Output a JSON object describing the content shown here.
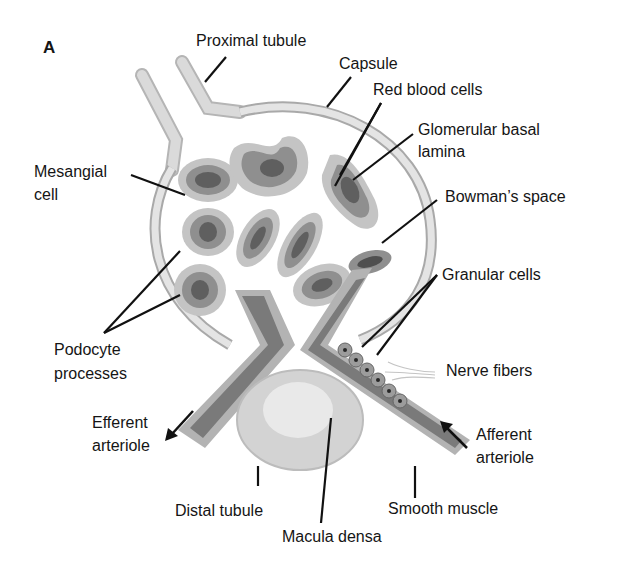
{
  "panel_letter": "A",
  "colors": {
    "background": "#ffffff",
    "capsule_fill": "#e2e2e2",
    "capsule_stroke": "#a9a9a9",
    "capillary_outer": "#bdbdbd",
    "capillary_mid": "#8f8f8f",
    "capillary_core": "#5f5f5f",
    "nucleus": "#262626",
    "arteriole_fill": "#7a7a7a",
    "arteriole_cells": "#b3b3b3",
    "tubule_fill": "#d3d3d3",
    "tubule_lumen": "#e9e9e9",
    "leader_line": "#111111",
    "text": "#151515"
  },
  "labels": {
    "proximal_tubule": "Proximal tubule",
    "capsule": "Capsule",
    "red_blood_cells": "Red blood cells",
    "glomerular_basal_lamina_1": "Glomerular basal",
    "glomerular_basal_lamina_2": "lamina",
    "mesangial_cell_1": "Mesangial",
    "mesangial_cell_2": "cell",
    "bowmans_space": "Bowman’s space",
    "granular_cells": "Granular cells",
    "podocyte_processes_1": "Podocyte",
    "podocyte_processes_2": "processes",
    "nerve_fibers": "Nerve fibers",
    "efferent_arteriole_1": "Efferent",
    "efferent_arteriole_2": "arteriole",
    "afferent_arteriole_1": "Afferent",
    "afferent_arteriole_2": "arteriole",
    "distal_tubule": "Distal tubule",
    "macula_densa": "Macula densa",
    "smooth_muscle": "Smooth muscle"
  }
}
